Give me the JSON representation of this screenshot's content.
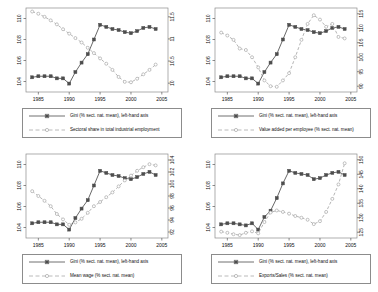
{
  "figure": {
    "title": "",
    "panel_count": 4,
    "background": "#ffffff"
  },
  "series_style": {
    "gini_color": "#4d4d4d",
    "secondary_color": "#a8a8a8",
    "gini_line": "solid",
    "secondary_line": "dashed"
  },
  "common": {
    "gini_legend_label": "Gini (% sect. nat. mean), left-hand axis",
    "x_ticks": [
      "1985",
      "1990",
      "1995",
      "2000",
      "2005"
    ],
    "left_ticks": [
      "104",
      "106",
      "108",
      "110"
    ],
    "x_range": [
      1983,
      2006
    ],
    "left_range": [
      103,
      111
    ]
  },
  "chart_data": [
    {
      "type": "line",
      "panel": "top-left",
      "title": "",
      "xlabel": "",
      "ylabel": "",
      "xlim": [
        1983,
        2006
      ],
      "ylim": [
        103,
        111
      ],
      "y2lim": [
        9.8,
        11.7
      ],
      "grid": false,
      "legend_position": "below",
      "xticks": [
        1985,
        1990,
        1995,
        2000,
        2005
      ],
      "yticks": [
        104,
        106,
        108,
        110
      ],
      "y2ticks": [
        10,
        10.5,
        11,
        11.5
      ],
      "y2ticklabels": [
        "10",
        "10.5",
        "11",
        "11.5"
      ],
      "x": [
        1984,
        1985,
        1986,
        1987,
        1988,
        1989,
        1990,
        1991,
        1992,
        1993,
        1994,
        1995,
        1996,
        1997,
        1998,
        1999,
        2000,
        2001,
        2002,
        2003,
        2004
      ],
      "series": [
        {
          "name": "Gini (% sect. nat. mean), left-hand axis",
          "axis": "left",
          "values": [
            104.4,
            104.5,
            104.5,
            104.5,
            104.3,
            104.3,
            103.8,
            104.9,
            105.8,
            106.6,
            108.0,
            109.4,
            109.2,
            109.0,
            108.9,
            108.7,
            108.6,
            108.8,
            109.1,
            109.2,
            109.0
          ]
        },
        {
          "name": "Sectoral share in total industrial employment",
          "axis": "right",
          "values": [
            11.62,
            11.57,
            11.5,
            11.42,
            11.33,
            11.22,
            11.12,
            11.02,
            10.92,
            10.8,
            10.68,
            10.56,
            10.44,
            10.3,
            10.14,
            10.03,
            10.02,
            10.1,
            10.2,
            10.3,
            10.42
          ]
        }
      ]
    },
    {
      "type": "line",
      "panel": "top-right",
      "title": "",
      "xlabel": "",
      "ylabel": "",
      "xlim": [
        1983,
        2006
      ],
      "ylim": [
        103,
        111
      ],
      "y2lim": [
        88,
        117
      ],
      "grid": false,
      "legend_position": "below",
      "xticks": [
        1985,
        1990,
        1995,
        2000,
        2005
      ],
      "yticks": [
        104,
        106,
        108,
        110
      ],
      "y2ticks": [
        90,
        95,
        100,
        105,
        110,
        115
      ],
      "y2ticklabels": [
        "90",
        "95",
        "100",
        "105",
        "110",
        "115"
      ],
      "x": [
        1984,
        1985,
        1986,
        1987,
        1988,
        1989,
        1990,
        1991,
        1992,
        1993,
        1994,
        1995,
        1996,
        1997,
        1998,
        1999,
        2000,
        2001,
        2002,
        2003,
        2004
      ],
      "series": [
        {
          "name": "Gini (% sect. nat. mean), left-hand axis",
          "axis": "left",
          "values": [
            104.4,
            104.5,
            104.5,
            104.5,
            104.3,
            104.3,
            103.8,
            104.9,
            105.8,
            106.6,
            108.0,
            109.4,
            109.2,
            109.0,
            108.9,
            108.7,
            108.6,
            108.8,
            109.1,
            109.2,
            109.0
          ]
        },
        {
          "name": "Value added per employee (% sect. nat. mean)",
          "axis": "right",
          "values": [
            108.5,
            107.5,
            106.0,
            103.0,
            102.5,
            100.0,
            96.5,
            92.0,
            90.0,
            89.8,
            92.0,
            94.5,
            100.0,
            106.0,
            111.5,
            114.5,
            113.0,
            110.5,
            111.5,
            107.0,
            106.5
          ]
        }
      ]
    },
    {
      "type": "line",
      "panel": "bottom-left",
      "title": "",
      "xlabel": "",
      "ylabel": "",
      "xlim": [
        1983,
        2006
      ],
      "ylim": [
        103,
        111
      ],
      "y2lim": [
        91,
        105
      ],
      "grid": false,
      "legend_position": "below",
      "xticks": [
        1985,
        1990,
        1995,
        2000,
        2005
      ],
      "yticks": [
        104,
        106,
        108,
        110
      ],
      "y2ticks": [
        92,
        94,
        96,
        98,
        100,
        102,
        104
      ],
      "y2ticklabels": [
        "92",
        "94",
        "96",
        "98",
        "100",
        "102",
        "104"
      ],
      "x": [
        1984,
        1985,
        1986,
        1987,
        1988,
        1989,
        1990,
        1991,
        1992,
        1993,
        1994,
        1995,
        1996,
        1997,
        1998,
        1999,
        2000,
        2001,
        2002,
        2003,
        2004
      ],
      "series": [
        {
          "name": "Gini (% sect. nat. mean), left-hand axis",
          "axis": "left",
          "values": [
            104.4,
            104.5,
            104.5,
            104.5,
            104.3,
            104.3,
            103.8,
            104.9,
            105.8,
            106.6,
            108.0,
            109.4,
            109.2,
            109.0,
            108.9,
            108.7,
            108.6,
            108.8,
            109.1,
            109.3,
            109.0
          ]
        },
        {
          "name": "Mean wage (% sect. nat. mean)",
          "axis": "right",
          "values": [
            98.8,
            98.0,
            97.2,
            96.3,
            95.0,
            94.1,
            93.2,
            93.6,
            94.2,
            95.2,
            96.3,
            97.0,
            97.8,
            98.6,
            99.6,
            100.6,
            101.4,
            102.2,
            102.8,
            103.3,
            103.1
          ]
        }
      ]
    },
    {
      "type": "line",
      "panel": "bottom-right",
      "title": "",
      "xlabel": "",
      "ylabel": "",
      "xlim": [
        1983,
        2006
      ],
      "ylim": [
        103,
        111
      ],
      "y2lim": [
        123,
        152
      ],
      "grid": false,
      "legend_position": "below",
      "xticks": [
        1985,
        1990,
        1995,
        2000,
        2005
      ],
      "yticks": [
        104,
        106,
        108,
        110
      ],
      "y2ticks": [
        125,
        130,
        135,
        140,
        145,
        150
      ],
      "y2ticklabels": [
        "125",
        "130",
        "135",
        "140",
        "145",
        "150"
      ],
      "x": [
        1984,
        1985,
        1986,
        1987,
        1988,
        1989,
        1990,
        1991,
        1992,
        1993,
        1994,
        1995,
        1996,
        1997,
        1998,
        1999,
        2000,
        2001,
        2002,
        2003,
        2004
      ],
      "series": [
        {
          "name": "Gini (% sect. nat. mean), left-hand axis",
          "axis": "left",
          "values": [
            104.3,
            104.4,
            104.4,
            104.3,
            104.2,
            104.4,
            103.8,
            105.0,
            105.6,
            106.8,
            108.2,
            109.4,
            109.2,
            109.1,
            109.0,
            108.6,
            108.7,
            109.0,
            109.2,
            109.3,
            109.0
          ]
        },
        {
          "name": "Exports/Sales (% sect. nat. mean)",
          "axis": "right",
          "values": [
            125.2,
            124.8,
            124.3,
            124.0,
            124.8,
            125.3,
            124.6,
            128.5,
            131.8,
            132.5,
            132.0,
            131.4,
            130.6,
            130.0,
            129.3,
            127.8,
            128.8,
            132.0,
            136.5,
            141.5,
            148.8
          ]
        }
      ]
    }
  ],
  "panels": [
    {
      "id": "top-left",
      "legend": [
        {
          "label": "Gini (% sect. nat. mean), left-hand axis",
          "style": "solid-marker"
        },
        {
          "label": "Sectoral share in total industrial employment",
          "style": "dashed-marker"
        }
      ]
    },
    {
      "id": "top-right",
      "legend": [
        {
          "label": "Gini (% sect. nat. mean), left-hand axis",
          "style": "solid-marker"
        },
        {
          "label": "Value added per employee (% sect. nat. mean)",
          "style": "dashed-marker"
        }
      ]
    },
    {
      "id": "bottom-left",
      "legend": [
        {
          "label": "Gini (% sect. nat. mean), left-hand axis",
          "style": "solid-marker"
        },
        {
          "label": "Mean wage (% sect. nat. mean)",
          "style": "dashed-marker"
        }
      ]
    },
    {
      "id": "bottom-right",
      "legend": [
        {
          "label": "Gini (% sect. nat. mean), left-hand axis",
          "style": "solid-marker"
        },
        {
          "label": "Exports/Sales (% sect. nat. mean)",
          "style": "dashed-marker"
        }
      ]
    }
  ]
}
